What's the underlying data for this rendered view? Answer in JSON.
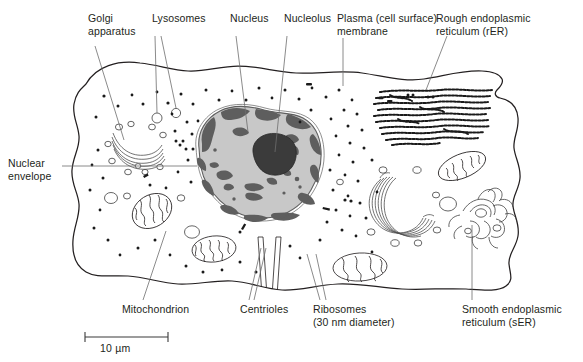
{
  "figure": {
    "background": "#ffffff",
    "ink": "#231f20",
    "nucleoplasm_color": "#c9c9c9",
    "chromatin_color": "#5e5e5e",
    "nucleolus_color": "#3b3b3b",
    "scale_bar": {
      "label": "10 µm",
      "x1": 85,
      "x2": 168,
      "y": 337
    }
  },
  "labels": [
    {
      "id": "golgi-apparatus",
      "text": "Golgi\napparatus",
      "x": 88,
      "y": 12,
      "align": "left"
    },
    {
      "id": "lysosomes",
      "text": "Lysosomes",
      "x": 152,
      "y": 12,
      "align": "left"
    },
    {
      "id": "nucleus",
      "text": "Nucleus",
      "x": 230,
      "y": 12,
      "align": "left"
    },
    {
      "id": "nucleolus",
      "text": "Nucleolus",
      "x": 284,
      "y": 12,
      "align": "left"
    },
    {
      "id": "plasma-membrane",
      "text": "Plasma (cell surface)\nmembrane",
      "x": 337,
      "y": 12,
      "align": "left"
    },
    {
      "id": "rough-er",
      "text": "Rough endoplasmic\nreticulum (rER)",
      "x": 436,
      "y": 12,
      "align": "left"
    },
    {
      "id": "nuclear-envelope",
      "text": "Nuclear\nenvelope",
      "x": 8,
      "y": 157,
      "align": "left"
    },
    {
      "id": "mitochondrion",
      "text": "Mitochondrion",
      "x": 122,
      "y": 310,
      "align": "left"
    },
    {
      "id": "centrioles",
      "text": "Centrioles",
      "x": 240,
      "y": 310,
      "align": "left"
    },
    {
      "id": "ribosomes",
      "text": "Ribosomes\n(30 nm diameter)",
      "x": 313,
      "y": 310,
      "align": "left"
    },
    {
      "id": "smooth-er",
      "text": "Smooth endoplasmic\nreticulum (sER)",
      "x": 462,
      "y": 310,
      "align": "left"
    }
  ],
  "structures": [
    {
      "id": "plasma-membrane",
      "name": "Plasma (cell surface) membrane"
    },
    {
      "id": "nucleus",
      "name": "Nucleus"
    },
    {
      "id": "nucleolus",
      "name": "Nucleolus"
    },
    {
      "id": "nuclear-envelope",
      "name": "Nuclear envelope"
    },
    {
      "id": "golgi-apparatus-left",
      "name": "Golgi apparatus"
    },
    {
      "id": "golgi-apparatus-right",
      "name": "Golgi apparatus"
    },
    {
      "id": "rough-er",
      "name": "Rough endoplasmic reticulum (rER)"
    },
    {
      "id": "smooth-er",
      "name": "Smooth endoplasmic reticulum (sER)"
    },
    {
      "id": "mitochondrion-upper-left",
      "name": "Mitochondrion"
    },
    {
      "id": "mitochondrion-mid-left",
      "name": "Mitochondrion"
    },
    {
      "id": "mitochondrion-bottom",
      "name": "Mitochondrion"
    },
    {
      "id": "mitochondrion-right",
      "name": "Mitochondrion"
    },
    {
      "id": "centrioles",
      "name": "Centrioles"
    },
    {
      "id": "ribosomes",
      "name": "Ribosomes (30 nm diameter)"
    },
    {
      "id": "lysosomes",
      "name": "Lysosomes"
    },
    {
      "id": "vesicles",
      "name": "Vesicles"
    }
  ]
}
